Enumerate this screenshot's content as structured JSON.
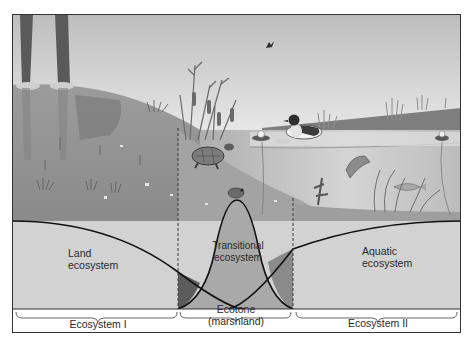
{
  "diagram": {
    "type": "ecotone illustration",
    "regions": [
      {
        "id": "land",
        "label": "Land ecosystem",
        "lines": [
          "Land",
          "ecosystem"
        ]
      },
      {
        "id": "transitional",
        "label": "Transitional ecosystem",
        "lines": [
          "Transitional",
          "ecosystem"
        ]
      },
      {
        "id": "aquatic",
        "label": "Aquatic ecosystem",
        "lines": [
          "Aquatic",
          "ecosystem"
        ]
      }
    ],
    "brackets": [
      {
        "id": "ecosystem-1",
        "lines": [
          "Ecosystem I"
        ]
      },
      {
        "id": "ecotone",
        "lines": [
          "Ecotone",
          "(marshland)"
        ]
      },
      {
        "id": "ecosystem-2",
        "lines": [
          "Ecosystem II"
        ]
      }
    ],
    "scene_elements": [
      "tree-trunks",
      "grass-hill",
      "cattails",
      "turtle",
      "frog",
      "duck",
      "water-lilies",
      "fish",
      "bird",
      "aquatic-plants"
    ],
    "colors": {
      "sky_top": "#c4c4c4",
      "sky_bottom": "#e8e8e8",
      "hill": "#9a9a9a",
      "water": "#b8b8b8",
      "band_light": "#d2d2d2",
      "band_mid": "#a8a8a8",
      "overlap_dark": "#5e5e5e",
      "frame": "#333333"
    }
  }
}
